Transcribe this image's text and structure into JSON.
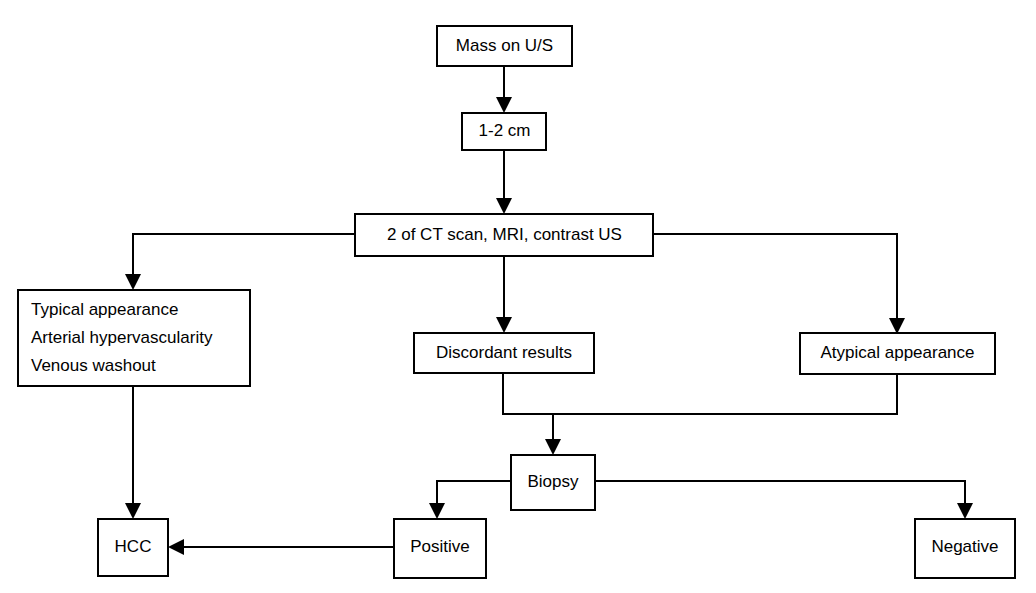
{
  "diagram": {
    "stroke_color": "#000000",
    "fill_color": "#ffffff",
    "nodes": {
      "mass_on_us": {
        "label": "Mass on U/S"
      },
      "size": {
        "label": "1-2 cm"
      },
      "imaging": {
        "label": "2 of CT scan, MRI, contrast US"
      },
      "typical": {
        "line1": "Typical appearance",
        "line2": "Arterial hypervascularity",
        "line3": "Venous washout"
      },
      "discordant": {
        "label": "Discordant results"
      },
      "atypical": {
        "label": "Atypical appearance"
      },
      "biopsy": {
        "label": "Biopsy"
      },
      "hcc": {
        "label": "HCC"
      },
      "positive": {
        "label": "Positive"
      },
      "negative": {
        "label": "Negative"
      }
    },
    "edges": [
      {
        "from": "mass_on_us",
        "to": "size"
      },
      {
        "from": "size",
        "to": "imaging"
      },
      {
        "from": "imaging",
        "to": "typical"
      },
      {
        "from": "imaging",
        "to": "discordant"
      },
      {
        "from": "imaging",
        "to": "atypical"
      },
      {
        "from": "typical",
        "to": "hcc"
      },
      {
        "from": "discordant",
        "to": "biopsy"
      },
      {
        "from": "atypical",
        "to": "biopsy"
      },
      {
        "from": "biopsy",
        "to": "positive"
      },
      {
        "from": "biopsy",
        "to": "negative"
      },
      {
        "from": "positive",
        "to": "hcc"
      }
    ]
  }
}
